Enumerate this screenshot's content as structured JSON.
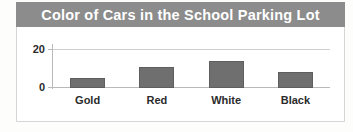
{
  "chart_data": {
    "type": "bar",
    "title": "Color of Cars in the School Parking Lot",
    "xlabel": "",
    "ylabel": "",
    "categories": [
      "Gold",
      "Red",
      "White",
      "Black"
    ],
    "values": [
      5,
      11,
      14,
      8
    ],
    "ylim": [
      0,
      20
    ],
    "yticks": [
      "0",
      "20"
    ],
    "grid": true,
    "legend": "none",
    "bar_color": "#706f6f",
    "title_bar_color": "#8c8c8c",
    "title_text_color": "#ffffff"
  },
  "background_bleed": {
    "line1": "are Fiction",
    "line2": "tion",
    "line3": "ook as a",
    "line4": "s a"
  }
}
